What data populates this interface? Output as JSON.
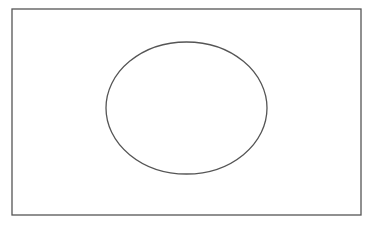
{
  "diagram": {
    "canvas": {
      "width": 373,
      "height": 228,
      "background": "#ffffff"
    },
    "shapes": [
      {
        "type": "rectangle",
        "name": "outer-frame",
        "x": 12,
        "y": 9,
        "width": 349,
        "height": 206,
        "stroke": "#555555",
        "stroke_width": 1.3,
        "fill": "none"
      },
      {
        "type": "ellipse",
        "name": "center-ellipse",
        "cx": 186.5,
        "cy": 108,
        "rx": 80.5,
        "ry": 66,
        "stroke": "#555555",
        "stroke_width": 1.3,
        "fill": "none"
      }
    ]
  }
}
